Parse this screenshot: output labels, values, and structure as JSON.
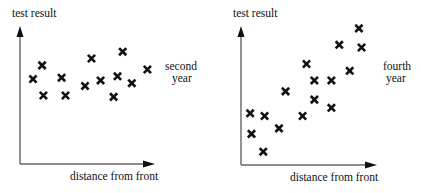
{
  "chart_data": [
    {
      "type": "scatter",
      "title": "",
      "xlabel": "distance from front",
      "ylabel": "test result",
      "annotation": [
        "second",
        "year"
      ],
      "xlim": [
        0,
        10
      ],
      "ylim": [
        0,
        10
      ],
      "grid": false,
      "ticks": "none",
      "marker": "x",
      "points": [
        {
          "x": 1.0,
          "y": 6.2
        },
        {
          "x": 1.7,
          "y": 7.2
        },
        {
          "x": 1.8,
          "y": 5.0
        },
        {
          "x": 3.2,
          "y": 6.3
        },
        {
          "x": 3.5,
          "y": 5.0
        },
        {
          "x": 5.0,
          "y": 5.7
        },
        {
          "x": 5.5,
          "y": 7.7
        },
        {
          "x": 6.2,
          "y": 6.1
        },
        {
          "x": 7.2,
          "y": 4.9
        },
        {
          "x": 7.5,
          "y": 6.4
        },
        {
          "x": 7.9,
          "y": 8.2
        },
        {
          "x": 8.6,
          "y": 5.9
        },
        {
          "x": 9.8,
          "y": 6.9
        }
      ]
    },
    {
      "type": "scatter",
      "title": "",
      "xlabel": "distance from front",
      "ylabel": "test result",
      "annotation": [
        "fourth",
        "year"
      ],
      "xlim": [
        0,
        10
      ],
      "ylim": [
        0,
        10
      ],
      "grid": false,
      "ticks": "none",
      "marker": "x",
      "points": [
        {
          "x": 0.7,
          "y": 3.7
        },
        {
          "x": 1.8,
          "y": 3.5
        },
        {
          "x": 0.8,
          "y": 2.2
        },
        {
          "x": 1.7,
          "y": 0.9
        },
        {
          "x": 2.9,
          "y": 2.6
        },
        {
          "x": 3.4,
          "y": 5.3
        },
        {
          "x": 4.7,
          "y": 3.5
        },
        {
          "x": 5.0,
          "y": 7.3
        },
        {
          "x": 5.6,
          "y": 6.1
        },
        {
          "x": 5.6,
          "y": 4.7
        },
        {
          "x": 6.9,
          "y": 6.1
        },
        {
          "x": 6.9,
          "y": 4.1
        },
        {
          "x": 8.3,
          "y": 6.8
        },
        {
          "x": 7.5,
          "y": 8.7
        },
        {
          "x": 9.2,
          "y": 8.5
        },
        {
          "x": 9.0,
          "y": 9.9
        }
      ]
    }
  ]
}
